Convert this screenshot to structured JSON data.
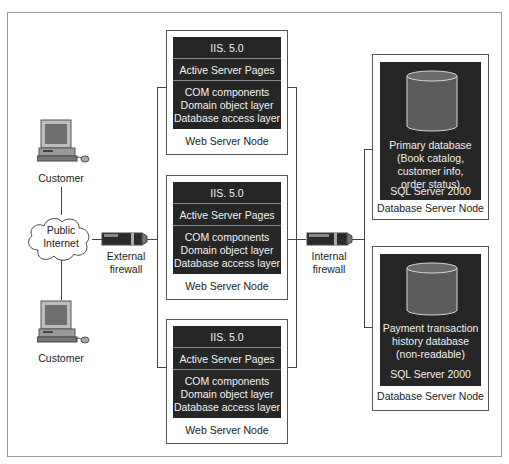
{
  "diagram": {
    "customers": [
      {
        "label": "Customer"
      },
      {
        "label": "Customer"
      }
    ],
    "internet": {
      "line1": "Public",
      "line2": "Internet"
    },
    "external_firewall": {
      "line1": "External",
      "line2": "firewall"
    },
    "internal_firewall": {
      "line1": "Internal",
      "line2": "firewall"
    },
    "web_servers": [
      {
        "iis": "IIS. 5.0",
        "asp": "Active Server Pages",
        "layers": [
          "COM components",
          "Domain object layer",
          "Database access layer"
        ],
        "caption": "Web Server Node"
      },
      {
        "iis": "IIS. 5.0",
        "asp": "Active Server Pages",
        "layers": [
          "COM components",
          "Domain object layer",
          "Database access layer"
        ],
        "caption": "Web Server Node"
      },
      {
        "iis": "IIS. 5.0",
        "asp": "Active Server Pages",
        "layers": [
          "COM components",
          "Domain object layer",
          "Database access layer"
        ],
        "caption": "Web Server Node"
      }
    ],
    "database_servers": [
      {
        "lines": [
          "Primary database",
          "(Book catalog,",
          "customer info,",
          "order status)"
        ],
        "product": "SQL Server 2000",
        "caption": "Database Server Node"
      },
      {
        "lines": [
          "Payment transaction",
          "history database",
          "(non-readable)"
        ],
        "product": "SQL Server 2000",
        "caption": "Database Server Node"
      }
    ]
  },
  "colors": {
    "node_fill": "#262626",
    "cylinder": "#5c5c5c",
    "line": "#444444",
    "frame": "#9a9a9a"
  }
}
